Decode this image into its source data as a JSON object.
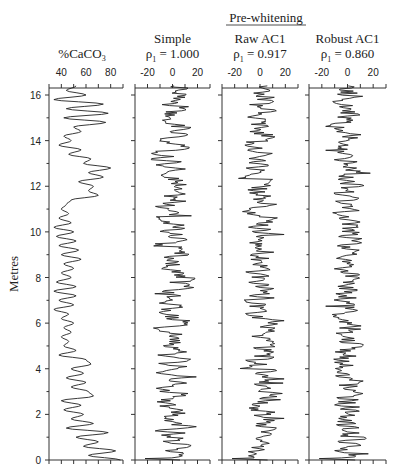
{
  "chart_data": {
    "type": "line",
    "layout": "four vertical panels sharing a depth y-axis",
    "group_title": "Pre-whitening",
    "ylabel": "Metres",
    "ylim": [
      0,
      16.5
    ],
    "yticks": [
      0,
      2,
      4,
      6,
      8,
      10,
      12,
      14,
      16
    ],
    "yticks_labels": [
      "0",
      "2",
      "4",
      "6",
      "8",
      "10",
      "12",
      "14",
      "16"
    ],
    "grid": false,
    "panels": [
      {
        "title": "%CaCO3",
        "title_main": "%CaCO",
        "title_sub": "3",
        "subtitle": "",
        "xlim": [
          30,
          90
        ],
        "xticks": [
          40,
          60,
          80
        ],
        "xtick_labels": [
          "40",
          "60",
          "80"
        ],
        "series_description": "Carbonate percentage vs depth; ~50% near 16 m, oscillating 35-80%, high (~80%) near 12.7 m and 0-1 m",
        "depth": [
          0.0,
          0.2,
          0.4,
          0.6,
          0.8,
          1.0,
          1.2,
          1.4,
          1.6,
          1.8,
          2.0,
          2.2,
          2.4,
          2.6,
          2.8,
          3.0,
          3.2,
          3.4,
          3.6,
          3.8,
          4.0,
          4.2,
          4.4,
          4.6,
          4.8,
          5.0,
          5.2,
          5.4,
          5.6,
          5.8,
          6.0,
          6.2,
          6.4,
          6.6,
          6.8,
          7.0,
          7.2,
          7.4,
          7.6,
          7.8,
          8.0,
          8.2,
          8.4,
          8.6,
          8.8,
          9.0,
          9.2,
          9.4,
          9.6,
          9.8,
          10.0,
          10.2,
          10.4,
          10.6,
          10.8,
          11.0,
          11.2,
          11.4,
          11.6,
          11.8,
          12.0,
          12.2,
          12.4,
          12.6,
          12.8,
          13.0,
          13.2,
          13.4,
          13.6,
          13.8,
          14.0,
          14.2,
          14.4,
          14.6,
          14.8,
          15.0,
          15.2,
          15.4,
          15.6,
          15.8,
          16.0,
          16.2,
          16.4
        ],
        "values": [
          88,
          62,
          84,
          58,
          70,
          52,
          78,
          44,
          66,
          48,
          58,
          42,
          56,
          40,
          66,
          62,
          48,
          60,
          44,
          58,
          48,
          64,
          60,
          38,
          52,
          42,
          46,
          40,
          48,
          42,
          50,
          40,
          46,
          34,
          50,
          38,
          52,
          34,
          52,
          36,
          48,
          40,
          50,
          42,
          56,
          40,
          54,
          38,
          52,
          36,
          50,
          34,
          48,
          38,
          46,
          40,
          44,
          48,
          70,
          62,
          66,
          54,
          74,
          62,
          80,
          58,
          64,
          46,
          56,
          38,
          48,
          42,
          56,
          50,
          76,
          42,
          78,
          44,
          74,
          34,
          60,
          44,
          52
        ]
      },
      {
        "title": "Simple",
        "subtitle_symbol": "ρ",
        "subtitle_sub": "1",
        "subtitle_value": " = 1.000",
        "xlim": [
          -30,
          30
        ],
        "xticks": [
          -20,
          0,
          20
        ],
        "xtick_labels": [
          "-20",
          "0",
          "20"
        ],
        "series_description": "Simple detrended residuals, roughly -15 to +15 around 0"
      },
      {
        "title": "Raw AC1",
        "subtitle_symbol": "ρ",
        "subtitle_sub": "1",
        "subtitle_value": " = 0.917",
        "xlim": [
          -30,
          30
        ],
        "xticks": [
          -20,
          0,
          20
        ],
        "xtick_labels": [
          "-20",
          "0",
          "20"
        ],
        "series_description": "Pre-whitened residuals using raw lag-1 autocorrelation, roughly -15 to +15"
      },
      {
        "title": "Robust AC1",
        "subtitle_symbol": "ρ",
        "subtitle_sub": "1",
        "subtitle_value": " = 0.860",
        "xlim": [
          -30,
          30
        ],
        "xticks": [
          -20,
          0,
          20
        ],
        "xtick_labels": [
          "-20",
          "0",
          "20"
        ],
        "series_description": "Pre-whitened residuals using robust lag-1 autocorrelation, roughly -15 to +15"
      }
    ]
  }
}
